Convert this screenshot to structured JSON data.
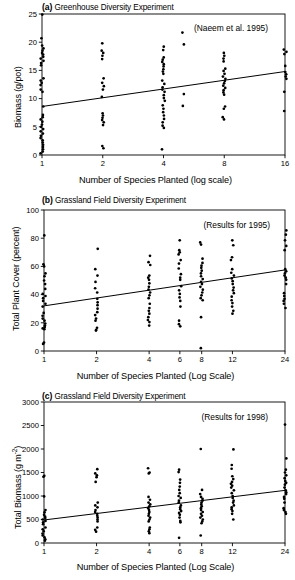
{
  "figure": {
    "panels": [
      {
        "key": "a",
        "label": "(a)",
        "title": "Greenhouse Diversity Experiment",
        "annotation": "(Naeem et al. 1995)",
        "ylabel": "Biomass (g/pot)",
        "xlabel": "Number of Species Planted (log scale)"
      },
      {
        "key": "b",
        "label": "(b)",
        "title": "Grassland Field Diversity Experiment",
        "annotation": "(Results for 1995)",
        "ylabel": "Total Plant Cover (percent)",
        "xlabel": "Number of Species Planted (Log Scale)"
      },
      {
        "key": "c",
        "label": "(c)",
        "title": "Grassland Field Diversity Experiment",
        "annotation": "(Results for 1998)",
        "ylabel_pre": "Total Biomass (g m",
        "ylabel_sup": "-2",
        "ylabel_post": ")",
        "ylabel": "Total Biomass (g m-2)",
        "xlabel": "Number of Species Planted (Log Scale)"
      }
    ]
  },
  "chart_data": [
    {
      "type": "scatter",
      "panel": "a",
      "title": "(a) Greenhouse Diversity Experiment",
      "annotations": [
        "(Naeem et al. 1995)"
      ],
      "xlabel": "Number of Species Planted (log scale)",
      "ylabel": "Biomass (g/pot)",
      "xscale": "log2",
      "xticks": [
        1,
        2,
        4,
        8,
        16
      ],
      "xticklabels": [
        "1",
        "2",
        "4",
        "8",
        "16"
      ],
      "xlim": [
        1,
        16
      ],
      "yticks": [
        0,
        5,
        10,
        15,
        20,
        25
      ],
      "ylim": [
        0,
        25
      ],
      "grid": false,
      "legend": "none",
      "regression_line": {
        "x": [
          1,
          16
        ],
        "y": [
          8.6,
          14.8
        ]
      },
      "series": [
        {
          "name": "1 species",
          "x": 1,
          "values": [
            24.9,
            20.7,
            19.4,
            18.9,
            18.5,
            18.1,
            17.8,
            17.4,
            17.1,
            16.7,
            16.3,
            15.9,
            13.6,
            13.2,
            12.8,
            12.4,
            11.6,
            11.2,
            8.6,
            7.1,
            6.7,
            6.3,
            5.9,
            5.4,
            5.0,
            4.6,
            4.2,
            3.8,
            3.4,
            3.0,
            2.6,
            2.2,
            1.8,
            1.4,
            1.0,
            0.6,
            0.3
          ]
        },
        {
          "name": "2 species",
          "x": 2,
          "values": [
            19.8,
            18.5,
            18.1,
            17.6,
            17.0,
            13.6,
            12.8,
            12.2,
            11.6,
            10.3,
            7.4,
            7.0,
            6.6,
            6.2,
            5.8,
            5.3,
            1.6,
            1.2
          ]
        },
        {
          "name": "4 species",
          "x": 4,
          "values": [
            19.2,
            18.6,
            17.3,
            16.9,
            16.5,
            16.1,
            15.7,
            15.2,
            14.8,
            14.4,
            13.2,
            12.6,
            12.0,
            11.6,
            11.2,
            10.6,
            10.1,
            9.6,
            8.8,
            8.2,
            7.6,
            7.0,
            6.4,
            5.8,
            5.2,
            4.8,
            1.0
          ]
        },
        {
          "name": "5 species",
          "x": 5,
          "values": [
            21.7,
            19.6,
            10.8,
            8.7
          ]
        },
        {
          "name": "8 species",
          "x": 8,
          "values": [
            18.1,
            17.6,
            17.1,
            16.6,
            15.3,
            14.9,
            14.4,
            13.9,
            13.5,
            13.1,
            12.7,
            12.3,
            11.9,
            11.5,
            11.1,
            10.7,
            8.6,
            8.2,
            6.7,
            6.3
          ]
        },
        {
          "name": "16 species",
          "x": 16,
          "values": [
            18.7,
            18.3,
            17.9,
            15.8,
            14.7,
            14.3,
            13.9,
            13.5,
            11.2,
            7.8
          ]
        }
      ]
    },
    {
      "type": "scatter",
      "panel": "b",
      "title": "(b) Grassland Field Diversity Experiment",
      "annotations": [
        "(Results for 1995)"
      ],
      "xlabel": "Number of Species Planted (Log Scale)",
      "ylabel": "Total Plant Cover (percent)",
      "xscale": "log",
      "xticks": [
        1,
        2,
        4,
        6,
        8,
        12,
        24
      ],
      "xticklabels": [
        "1",
        "2",
        "4",
        "6",
        "8",
        "12",
        "24"
      ],
      "xlim": [
        1,
        24
      ],
      "yticks": [
        0,
        20,
        40,
        60,
        80,
        100
      ],
      "ylim": [
        0,
        100
      ],
      "grid": false,
      "legend": "none",
      "regression_line": {
        "x": [
          1,
          24
        ],
        "y": [
          32,
          57.5
        ]
      },
      "series": [
        {
          "name": "1 species",
          "x": 1,
          "values": [
            82,
            61.5,
            60,
            55,
            53,
            50,
            47.5,
            44,
            40.5,
            39,
            37.5,
            35.5,
            33.5,
            31.5,
            27,
            25,
            23,
            21.5,
            19.5,
            18,
            17,
            16,
            15.5,
            6,
            5
          ]
        },
        {
          "name": "2 species",
          "x": 2,
          "values": [
            72.5,
            58,
            53.5,
            49,
            44.5,
            41.5,
            37,
            34.5,
            32.5,
            30,
            27.5,
            25.5,
            23,
            21.5,
            16.5,
            15,
            14.5
          ]
        },
        {
          "name": "4 species",
          "x": 4,
          "values": [
            67.5,
            63,
            61,
            53.5,
            52,
            50.5,
            48,
            45.5,
            43.5,
            41.5,
            39.5,
            37.5,
            33.5,
            30.5,
            28.5,
            26.5,
            24,
            22,
            20.5,
            18
          ]
        },
        {
          "name": "6 species",
          "x": 6,
          "values": [
            78.5,
            71.5,
            70,
            68.5,
            64.5,
            62,
            58.5,
            54.5,
            52,
            50.5,
            46,
            43,
            40.5,
            38,
            35.5,
            31.5,
            21.5,
            19,
            17.5
          ]
        },
        {
          "name": "8 species",
          "x": 8,
          "values": [
            77,
            75.5,
            65.5,
            62.5,
            60.5,
            59,
            57,
            55,
            53,
            51,
            49,
            47.5,
            45.5,
            43.5,
            41.5,
            39.5,
            37.5,
            36,
            24,
            2
          ]
        },
        {
          "name": "12 species",
          "x": 12,
          "values": [
            78.5,
            75,
            66.5,
            64.5,
            58,
            55.5,
            53.5,
            51.5,
            49.5,
            47.5,
            45,
            43,
            41,
            38.5,
            36,
            34,
            31.5,
            28.5,
            26.5
          ]
        },
        {
          "name": "24 species",
          "x": 24,
          "values": [
            85.5,
            82.5,
            78.5,
            74.5,
            71.5,
            58,
            56.5,
            55,
            53.5,
            52,
            50.5,
            47.5,
            41,
            39,
            37,
            35.5,
            33.5,
            30.5
          ]
        }
      ]
    },
    {
      "type": "scatter",
      "panel": "c",
      "title": "(c) Grassland Field Diversity Experiment",
      "annotations": [
        "(Results for 1998)"
      ],
      "xlabel": "Number of Species Planted (Log Scale)",
      "ylabel": "Total Biomass (g m-2)",
      "xscale": "log",
      "xticks": [
        1,
        2,
        4,
        6,
        8,
        12,
        24
      ],
      "xticklabels": [
        "1",
        "2",
        "4",
        "6",
        "8",
        "12",
        "24"
      ],
      "xlim": [
        1,
        24
      ],
      "yticks": [
        0,
        500,
        1000,
        1500,
        2000,
        2500,
        3000
      ],
      "ylim": [
        0,
        3000
      ],
      "grid": false,
      "legend": "none",
      "regression_line": {
        "x": [
          1,
          24
        ],
        "y": [
          490,
          1120
        ]
      },
      "series": [
        {
          "name": "1 species",
          "x": 1,
          "values": [
            1430,
            1410,
            990,
            700,
            650,
            600,
            560,
            530,
            500,
            470,
            440,
            400,
            330,
            290,
            250,
            200,
            160,
            120,
            80,
            50
          ]
        },
        {
          "name": "2 species",
          "x": 2,
          "values": [
            1570,
            1480,
            1440,
            1400,
            1300,
            860,
            800,
            760,
            700,
            660,
            620,
            580,
            540,
            500,
            460,
            330,
            280,
            240
          ]
        },
        {
          "name": "4 species",
          "x": 4,
          "values": [
            1590,
            1500,
            1480,
            980,
            920,
            860,
            820,
            780,
            740,
            700,
            660,
            620,
            580,
            540,
            500,
            460,
            330,
            290,
            250,
            210
          ]
        },
        {
          "name": "6 species",
          "x": 6,
          "values": [
            1560,
            1510,
            1350,
            1280,
            1200,
            1130,
            1060,
            1000,
            960,
            900,
            860,
            800,
            760,
            720,
            680,
            640,
            600,
            540,
            470,
            440,
            110
          ]
        },
        {
          "name": "8 species",
          "x": 8,
          "values": [
            2000,
            1130,
            1040,
            980,
            940,
            900,
            860,
            820,
            780,
            740,
            700,
            660,
            620,
            580,
            540,
            500,
            460,
            420,
            160
          ]
        },
        {
          "name": "12 species",
          "x": 12,
          "values": [
            1990,
            1660,
            1580,
            1420,
            1360,
            1300,
            1260,
            1220,
            1180,
            1120,
            1060,
            1000,
            960,
            900,
            860,
            800,
            760,
            720,
            680,
            620,
            500
          ]
        },
        {
          "name": "24 species",
          "x": 24,
          "values": [
            2520,
            1800,
            1560,
            1500,
            1440,
            1380,
            1320,
            1280,
            1240,
            1180,
            1120,
            1080,
            1040,
            980,
            940,
            860,
            740,
            700,
            660,
            620
          ]
        }
      ]
    }
  ]
}
